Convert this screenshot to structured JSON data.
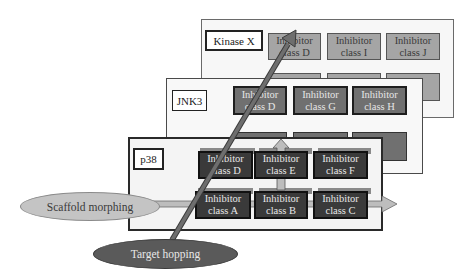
{
  "diagram": {
    "panels": [
      {
        "id": "kinase-x",
        "label": "Kinase X",
        "boxes": [
          {
            "line1": "Inhibitor",
            "line2": "class D"
          },
          {
            "line1": "Inhibitor",
            "line2": "class I"
          },
          {
            "line1": "Inhibitor",
            "line2": "class J"
          }
        ]
      },
      {
        "id": "jnk3",
        "label": "JNK3",
        "boxes": [
          {
            "line1": "Inhibitor",
            "line2": "class D"
          },
          {
            "line1": "Inhibitor",
            "line2": "class G"
          },
          {
            "line1": "Inhibitor",
            "line2": "class H"
          }
        ]
      },
      {
        "id": "p38",
        "label": "p38",
        "boxes": [
          {
            "line1": "Inhibitor",
            "line2": "class D"
          },
          {
            "line1": "Inhibitor",
            "line2": "class E"
          },
          {
            "line1": "Inhibitor",
            "line2": "class F"
          },
          {
            "line1": "Inhibitor",
            "line2": "class A"
          },
          {
            "line1": "Inhibitor",
            "line2": "class B"
          },
          {
            "line1": "Inhibitor",
            "line2": "class C"
          }
        ]
      }
    ],
    "callouts": {
      "scaffold_morphing": "Scaffold morphing",
      "target_hopping": "Target hopping"
    },
    "colors": {
      "panel_border_back": "#6a6a6a",
      "box_back": "#a5a5a5",
      "box_mid": "#707070",
      "box_front": "#3a3a3a",
      "scaffold_ellipse": "#c4c4c4",
      "target_ellipse": "#5a5a5a",
      "arrow": "#b8b8b8",
      "hop_arrow": "#6e6e6e"
    }
  }
}
